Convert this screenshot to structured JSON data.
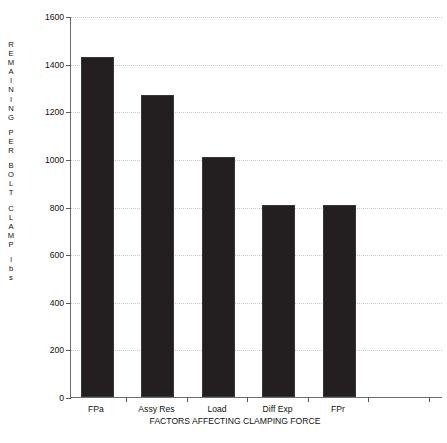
{
  "chart_data": {
    "type": "bar",
    "title": "",
    "subtitle": "",
    "categories": [
      "FPa",
      "Assy Res",
      "Load",
      "Diff Exp",
      "FPr"
    ],
    "values": [
      1420,
      1260,
      1000,
      800,
      800
    ],
    "series": [
      {
        "name": "Remaining per bolt clamp",
        "values": [
          1420,
          1260,
          1000,
          800,
          800
        ]
      }
    ],
    "xlabel": "FACTORS AFFECTING CLAMPING FORCE",
    "ylabel": "REMAINING PER BOLT CLAMP lbs",
    "ylabel_lines": [
      "REMAINING",
      "PER",
      "BOLT",
      "CLAMP",
      "lbs"
    ],
    "ylim": [
      0,
      1600
    ],
    "ytick_labels": [
      "1600",
      "1400",
      "1200",
      "1000",
      "800",
      "600",
      "400",
      "200",
      "0"
    ],
    "ytick_values": [
      1600,
      1400,
      1200,
      1000,
      800,
      600,
      400,
      200,
      0
    ],
    "grid": true,
    "grid_axis": "y",
    "grid_style": "dotted",
    "legend": null,
    "legend_position": "none",
    "bar_color": "#231f20",
    "axis_color": "#6d6d6d",
    "grid_color": "#c8c8c8",
    "background_color": "#ffffff",
    "extra_xticks": 3
  }
}
